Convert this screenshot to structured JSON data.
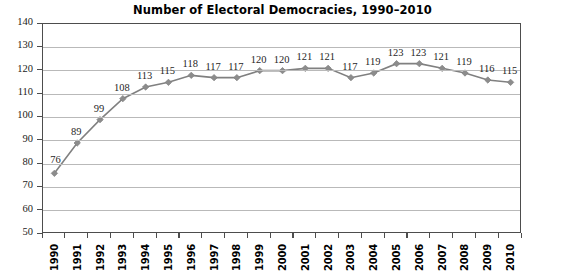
{
  "chart_data": {
    "type": "line",
    "title": "Number of Electoral Democracies, 1990–2010",
    "xlabel": "",
    "ylabel": "",
    "categories": [
      "1990",
      "1991",
      "1992",
      "1993",
      "1994",
      "1995",
      "1996",
      "1997",
      "1998",
      "1999",
      "2000",
      "2001",
      "2002",
      "2003",
      "2004",
      "2005",
      "2006",
      "2007",
      "2008",
      "2009",
      "2010"
    ],
    "values": [
      76,
      89,
      99,
      108,
      113,
      115,
      118,
      117,
      117,
      120,
      120,
      121,
      121,
      117,
      119,
      123,
      123,
      121,
      119,
      116,
      115
    ],
    "data_labels": [
      "76",
      "89",
      "99",
      "108",
      "113",
      "115",
      "118",
      "117",
      "117",
      "120",
      "120",
      "121",
      "121",
      "117",
      "119",
      "123",
      "123",
      "121",
      "119",
      "116",
      "115"
    ],
    "ylim": [
      50,
      140
    ],
    "yticks": [
      50,
      60,
      70,
      80,
      90,
      100,
      110,
      120,
      130,
      140
    ],
    "ytick_labels": [
      "50",
      "60",
      "70",
      "80",
      "90",
      "100",
      "110",
      "120",
      "130",
      "140"
    ],
    "grid": true,
    "legend": false,
    "legend_position": "none",
    "series": [
      {
        "name": "Electoral Democracies",
        "values": [
          76,
          89,
          99,
          108,
          113,
          115,
          118,
          117,
          117,
          120,
          120,
          121,
          121,
          117,
          119,
          123,
          123,
          121,
          119,
          116,
          115
        ]
      }
    ],
    "colors": {
      "line": "#808080",
      "marker": "#8c8c8c",
      "gridline": "#b9b9b9",
      "axis": "#4d4d4d",
      "text": "#1a1a1a",
      "background": "#ffffff"
    },
    "marker_shape": "diamond"
  }
}
